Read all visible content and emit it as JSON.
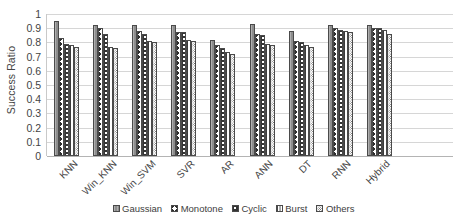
{
  "chart_data": {
    "type": "bar",
    "title": "",
    "xlabel": "",
    "ylabel": "Success Ratio",
    "ylim": [
      0,
      1
    ],
    "ytick_labels": [
      "1",
      "0.9",
      "0.8",
      "0.7",
      "0.6",
      "0.5",
      "0.4",
      "0.3",
      "0.2",
      "0.1",
      "0"
    ],
    "ytick_values": [
      1,
      0.9,
      0.8,
      0.7,
      0.6,
      0.5,
      0.4,
      0.3,
      0.2,
      0.1,
      0
    ],
    "grid": true,
    "legend_position": "bottom",
    "categories": [
      "KNN",
      "Win_KNN",
      "Win_SVM",
      "SVR",
      "AR",
      "ANN",
      "DT",
      "RNN",
      "Hybrid"
    ],
    "series": [
      {
        "name": "Gaussian",
        "pattern": "solid-grey",
        "values": [
          0.95,
          0.92,
          0.92,
          0.92,
          0.82,
          0.93,
          0.88,
          0.92,
          0.92
        ]
      },
      {
        "name": "Monotone",
        "pattern": "chevron",
        "values": [
          0.83,
          0.9,
          0.88,
          0.87,
          0.78,
          0.86,
          0.81,
          0.9,
          0.9
        ]
      },
      {
        "name": "Cyclic",
        "pattern": "chevron-dense",
        "values": [
          0.79,
          0.86,
          0.86,
          0.87,
          0.76,
          0.85,
          0.8,
          0.89,
          0.9
        ]
      },
      {
        "name": "Burst",
        "pattern": "vertical-lines",
        "values": [
          0.78,
          0.77,
          0.81,
          0.82,
          0.73,
          0.79,
          0.78,
          0.88,
          0.89
        ]
      },
      {
        "name": "Others",
        "pattern": "stipple",
        "values": [
          0.77,
          0.76,
          0.8,
          0.81,
          0.72,
          0.78,
          0.77,
          0.87,
          0.86
        ]
      }
    ]
  },
  "legend": {
    "items": [
      {
        "label": "Gaussian"
      },
      {
        "label": "Monotone"
      },
      {
        "label": "Cyclic"
      },
      {
        "label": "Burst"
      },
      {
        "label": "Others"
      }
    ]
  }
}
